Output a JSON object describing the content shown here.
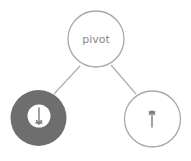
{
  "diagram": {
    "type": "tree",
    "colors": {
      "background": "#ffffff",
      "stroke": "#a8a8a8",
      "edge": "#b0b0b0",
      "text": "#8a8a8a",
      "filled_node": "#6e6e6e",
      "arrow": "#7a7a7a"
    },
    "nodes": [
      {
        "id": "pivot",
        "label": "pivot",
        "style": "outline"
      },
      {
        "id": "left",
        "label": "",
        "icon": "arrow-down-icon",
        "style": "filled"
      },
      {
        "id": "right",
        "label": "",
        "icon": "arrow-up-icon",
        "style": "outline"
      }
    ],
    "edges": [
      {
        "from": "pivot",
        "to": "left"
      },
      {
        "from": "pivot",
        "to": "right"
      }
    ]
  }
}
